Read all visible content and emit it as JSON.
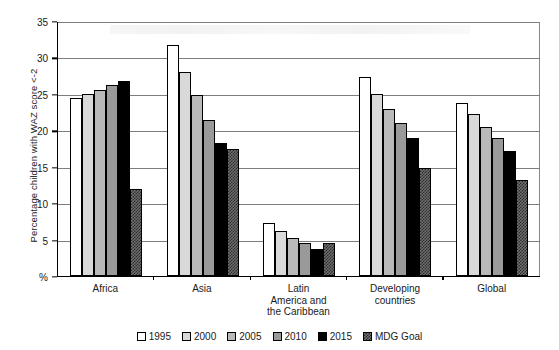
{
  "chart_data": {
    "type": "bar",
    "title": "",
    "xlabel": "",
    "ylabel": "Percentage children with WAZ score <-2",
    "ylim": [
      0,
      35
    ],
    "yticks": [
      "%",
      "5",
      "10",
      "15",
      "20",
      "25",
      "30",
      "35"
    ],
    "grid": true,
    "legend_position": "bottom",
    "categories": [
      "Africa",
      "Asia",
      "Latin America and the Caribbean",
      "Developing countries",
      "Global"
    ],
    "category_lines": [
      [
        "Africa"
      ],
      [
        "Asia"
      ],
      [
        "Latin",
        "America and",
        "the Caribbean"
      ],
      [
        "Developing",
        "countries"
      ],
      [
        "Global"
      ]
    ],
    "series": [
      {
        "name": "1995",
        "color": "#ffffff",
        "values": [
          24.4,
          31.7,
          7.3,
          27.3,
          23.8
        ]
      },
      {
        "name": "2000",
        "color": "#d9d9d9",
        "values": [
          25.0,
          28.0,
          6.2,
          25.0,
          22.2
        ]
      },
      {
        "name": "2005",
        "color": "#b9b9b9",
        "values": [
          25.5,
          24.9,
          5.2,
          22.9,
          20.5
        ]
      },
      {
        "name": "2010",
        "color": "#9a9a9a",
        "values": [
          26.2,
          21.4,
          4.5,
          21.0,
          19.0
        ]
      },
      {
        "name": "2015",
        "color": "#000000",
        "values": [
          26.8,
          18.3,
          3.7,
          18.9,
          17.2
        ]
      },
      {
        "name": "MDG Goal",
        "color": "#6e6e6e",
        "values": [
          12.0,
          17.5,
          4.6,
          14.8,
          13.2
        ]
      }
    ]
  }
}
